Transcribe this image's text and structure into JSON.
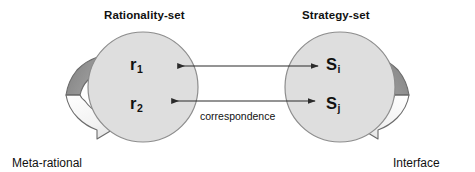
{
  "diagram": {
    "type": "relationship-diagram",
    "sets": [
      {
        "id": "rationality-set",
        "title": "Rationality-set",
        "nodes": [
          {
            "id": "r1",
            "symbol": "r",
            "subscript": "1"
          },
          {
            "id": "r2",
            "symbol": "r",
            "subscript": "2"
          }
        ],
        "loop_caption_line1": "Meta-rational",
        "loop_caption_line2": "relationship"
      },
      {
        "id": "strategy-set",
        "title": "Strategy-set",
        "nodes": [
          {
            "id": "si",
            "symbol": "S",
            "subscript": "i"
          },
          {
            "id": "sj",
            "symbol": "S",
            "subscript": "j"
          }
        ],
        "loop_caption_line1": "Interface",
        "loop_caption_line2": "relationship"
      }
    ],
    "connections": {
      "label": "correspondence",
      "arrows": [
        {
          "from": "si",
          "to": "r1",
          "style": "bidirectional"
        },
        {
          "from": "sj",
          "to": "r2",
          "style": "bidirectional"
        }
      ]
    },
    "colors": {
      "circle_fill": "#dedede",
      "circle_stroke": "#8a8a8a",
      "loop_band_dark": "#8f8f8f",
      "loop_band_light": "#ededed",
      "loop_stroke": "#6f6f6f",
      "arrow_line": "#2b2b2b",
      "text": "#111111",
      "background": "#ffffff"
    }
  }
}
